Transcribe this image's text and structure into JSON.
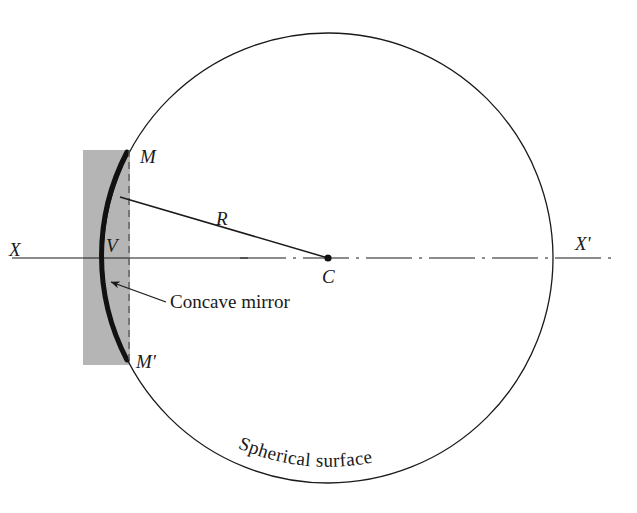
{
  "figure": {
    "kind": "optics-ray-diagram",
    "background_color": "#ffffff",
    "ink_color": "#1a1a1a",
    "block_fill_color": "#b5b5b5",
    "mirror_color": "#111111"
  },
  "labels": {
    "axis_left": "X",
    "axis_right": "X'",
    "mirror_top": "M",
    "mirror_bottom": "M'",
    "vertex": "V",
    "center": "C",
    "radius": "R",
    "callout_mirror": "Concave mirror",
    "circle_caption": "Spherical surface"
  },
  "geometry": {
    "circle_center_x": 328,
    "circle_center_y": 258,
    "circle_radius": 225,
    "axis_y": 258,
    "axis_x_start": 12,
    "axis_x_end": 612,
    "vertex_x": 103,
    "vertex_y": 258,
    "mirror_top_x": 127,
    "mirror_top_y": 152,
    "mirror_bottom_x": 127,
    "mirror_bottom_y": 360,
    "dashed_chord_x": 129,
    "dashed_chord_y_top": 150,
    "dashed_chord_y_bottom": 360,
    "block_left": 83,
    "block_top": 150,
    "block_width": 47,
    "block_height": 215,
    "radius_line_from_x": 120,
    "radius_line_from_y": 197,
    "radius_line_to_x": 328,
    "radius_line_to_y": 258,
    "callout_arrow_tip_x": 110,
    "callout_arrow_tip_y": 282,
    "callout_arrow_tail_x": 166,
    "callout_arrow_tail_y": 302
  },
  "label_positions": {
    "axis_left": {
      "x": 9,
      "y": 256
    },
    "axis_right": {
      "x": 575,
      "y": 250
    },
    "mirror_top": {
      "x": 140,
      "y": 163
    },
    "mirror_bottom": {
      "x": 136,
      "y": 368
    },
    "vertex": {
      "x": 106,
      "y": 252
    },
    "center": {
      "x": 322,
      "y": 283
    },
    "radius": {
      "x": 216,
      "y": 225
    },
    "callout_mirror": {
      "x": 170,
      "y": 308
    }
  }
}
